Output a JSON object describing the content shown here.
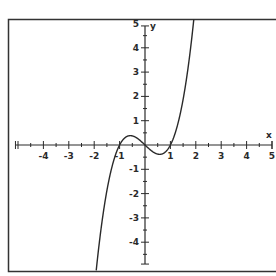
{
  "chart_data": {
    "type": "line",
    "title": "",
    "function": "y = x^3 - x",
    "xlabel": "x",
    "ylabel": "y",
    "xlim": [
      -5,
      5
    ],
    "ylim": [
      -5,
      5
    ],
    "grid": false,
    "x_ticks": [
      -4,
      -3,
      -2,
      -1,
      1,
      2,
      3,
      4,
      5
    ],
    "y_ticks": [
      -4,
      -3,
      -2,
      -1,
      1,
      2,
      3,
      4,
      5
    ],
    "minor_ticks_per_unit": 2,
    "series": [
      {
        "name": "f(x)",
        "x": [
          -1.9,
          -1.75,
          -1.5,
          -1.25,
          -1.0,
          -0.75,
          -0.577,
          -0.25,
          0.0,
          0.25,
          0.577,
          0.75,
          1.0,
          1.25,
          1.5,
          1.75,
          1.9
        ],
        "y": [
          -4.96,
          -3.61,
          -1.875,
          -0.703,
          0.0,
          0.328,
          0.385,
          0.234,
          0.0,
          -0.234,
          -0.385,
          -0.328,
          0.0,
          0.703,
          1.875,
          3.61,
          4.96
        ]
      }
    ],
    "colors": {
      "curve": "#2a2a2a",
      "axes": "#2a2a2a",
      "frame": "#333333",
      "background": "#ffffff"
    }
  }
}
